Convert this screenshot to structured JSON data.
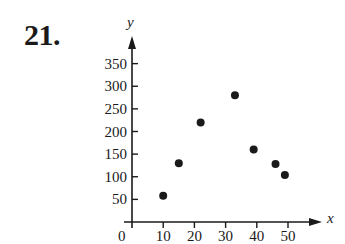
{
  "problem": {
    "number": "21."
  },
  "chart_data": {
    "type": "scatter",
    "title": "",
    "xlabel": "x",
    "ylabel": "y",
    "xlim": [
      0,
      55
    ],
    "ylim": [
      0,
      370
    ],
    "grid": false,
    "legend": null,
    "x_ticks": [
      10,
      20,
      30,
      40,
      50
    ],
    "y_ticks": [
      50,
      100,
      150,
      200,
      250,
      300,
      350
    ],
    "origin_label": "0",
    "points": [
      {
        "x": 10,
        "y": 58
      },
      {
        "x": 15,
        "y": 130
      },
      {
        "x": 22,
        "y": 220
      },
      {
        "x": 33,
        "y": 280
      },
      {
        "x": 39,
        "y": 160
      },
      {
        "x": 46,
        "y": 128
      },
      {
        "x": 49,
        "y": 104
      }
    ],
    "marker_color": "#1a1a1a"
  }
}
